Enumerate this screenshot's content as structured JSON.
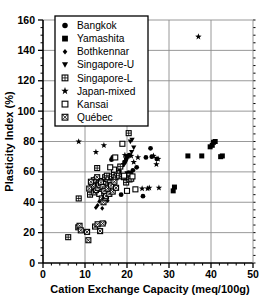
{
  "chart_data": {
    "type": "scatter",
    "title": "",
    "xlabel": "Cation Exchange Capacity (meq/100g)",
    "ylabel": "Plasticity Index (%)",
    "xlim": [
      0,
      50
    ],
    "ylim": [
      0,
      160
    ],
    "xticks": [
      0,
      10,
      20,
      30,
      40,
      50
    ],
    "yticks": [
      0,
      20,
      40,
      60,
      80,
      100,
      120,
      140,
      160
    ],
    "xtick_labels": [
      "0",
      "10",
      "20",
      "30",
      "40",
      "50"
    ],
    "ytick_labels": [
      "0",
      "20",
      "40",
      "60",
      "80",
      "100",
      "120",
      "140",
      "160"
    ],
    "x_minor_step": 2,
    "y_minor_step": 5,
    "grid": "major-both",
    "legend_position": "upper-left-inside",
    "series": [
      {
        "name": "Bangkok",
        "marker": "filled-circle",
        "points": [
          [
            14.6,
            26.5
          ],
          [
            15.2,
            49.5
          ],
          [
            15.8,
            50.0
          ],
          [
            16.6,
            69.5
          ],
          [
            16.3,
            68.0
          ],
          [
            18.2,
            60.5
          ],
          [
            18.6,
            45.0
          ],
          [
            19.0,
            64.5
          ],
          [
            19.4,
            66.5
          ],
          [
            19.8,
            68.5
          ],
          [
            20.1,
            70.0
          ],
          [
            20.5,
            71.0
          ],
          [
            20.4,
            59.5
          ],
          [
            20.9,
            59.0
          ],
          [
            21.4,
            61.0
          ],
          [
            22.3,
            63.0
          ],
          [
            23.8,
            44.0
          ],
          [
            24.5,
            69.5
          ],
          [
            25.6,
            75.5
          ],
          [
            25.9,
            70.0
          ],
          [
            27.1,
            68.5
          ]
        ]
      },
      {
        "name": "Yamashita",
        "marker": "filled-square",
        "points": [
          [
            31.0,
            47.5
          ],
          [
            31.3,
            50.0
          ],
          [
            34.5,
            70.5
          ],
          [
            37.8,
            70.5
          ],
          [
            39.8,
            76.5
          ],
          [
            40.3,
            77.5
          ],
          [
            40.6,
            79.5
          ],
          [
            41.0,
            80.0
          ],
          [
            42.3,
            70.0
          ],
          [
            42.7,
            70.5
          ]
        ]
      },
      {
        "name": "Bothkennar",
        "marker": "small-diamond",
        "points": [
          [
            12.6,
            36.5
          ],
          [
            13.0,
            38.0
          ],
          [
            13.4,
            40.5
          ],
          [
            13.8,
            42.0
          ],
          [
            14.1,
            36.0
          ],
          [
            14.4,
            39.5
          ],
          [
            14.8,
            44.5
          ],
          [
            15.1,
            46.5
          ],
          [
            15.4,
            41.0
          ],
          [
            15.8,
            48.0
          ],
          [
            16.1,
            52.0
          ],
          [
            16.4,
            54.0
          ],
          [
            16.8,
            50.5
          ],
          [
            17.1,
            56.0
          ]
        ]
      },
      {
        "name": "Singapore-U",
        "marker": "down-triangle",
        "points": [
          [
            20.8,
            80.0
          ],
          [
            21.2,
            81.0
          ],
          [
            21.6,
            76.0
          ],
          [
            21.1,
            73.0
          ],
          [
            19.6,
            66.0
          ],
          [
            20.0,
            59.0
          ],
          [
            20.3,
            57.0
          ]
        ]
      },
      {
        "name": "Singapore-L",
        "marker": "crossed-square",
        "points": [
          [
            6.0,
            17.0
          ],
          [
            8.5,
            42.5
          ],
          [
            11.2,
            45.0
          ],
          [
            11.6,
            50.0
          ],
          [
            12.0,
            52.0
          ],
          [
            12.3,
            53.5
          ],
          [
            12.7,
            55.0
          ],
          [
            13.1,
            52.5
          ],
          [
            13.5,
            50.0
          ],
          [
            12.9,
            62.5
          ],
          [
            14.0,
            54.0
          ],
          [
            14.4,
            52.0
          ],
          [
            14.8,
            56.5
          ],
          [
            15.2,
            57.5
          ],
          [
            15.6,
            55.0
          ],
          [
            16.0,
            53.0
          ],
          [
            16.4,
            57.0
          ],
          [
            16.9,
            58.0
          ],
          [
            17.3,
            56.5
          ],
          [
            17.7,
            59.0
          ],
          [
            18.1,
            57.5
          ],
          [
            18.4,
            63.5
          ],
          [
            18.9,
            57.0
          ],
          [
            19.3,
            56.5
          ],
          [
            19.8,
            53.0
          ],
          [
            20.2,
            57.5
          ],
          [
            20.6,
            55.0
          ],
          [
            21.0,
            55.5
          ],
          [
            20.4,
            85.5
          ]
        ]
      },
      {
        "name": "Japan-mixed",
        "marker": "star",
        "points": [
          [
            8.5,
            80.0
          ],
          [
            12.6,
            73.0
          ],
          [
            14.5,
            77.5
          ],
          [
            19.5,
            71.0
          ],
          [
            21.0,
            70.5
          ],
          [
            21.6,
            66.5
          ],
          [
            22.6,
            69.5
          ],
          [
            23.6,
            49.0
          ],
          [
            24.9,
            49.0
          ],
          [
            25.3,
            49.5
          ],
          [
            26.3,
            70.5
          ],
          [
            27.0,
            65.0
          ],
          [
            27.4,
            68.5
          ],
          [
            27.6,
            49.5
          ],
          [
            37.0,
            149.0
          ]
        ]
      },
      {
        "name": "Kansai",
        "marker": "open-square",
        "points": [
          [
            18.9,
            78.5
          ],
          [
            17.2,
            69.5
          ],
          [
            16.9,
            61.5
          ],
          [
            16.0,
            63.0
          ],
          [
            19.3,
            57.5
          ],
          [
            21.3,
            57.0
          ],
          [
            22.0,
            48.5
          ],
          [
            13.4,
            45.5
          ],
          [
            20.0,
            47.5
          ]
        ]
      },
      {
        "name": "Québec",
        "marker": "boxed-x-square",
        "points": [
          [
            8.4,
            23.5
          ],
          [
            8.7,
            24.5
          ],
          [
            9.0,
            21.5
          ],
          [
            10.5,
            20.5
          ],
          [
            10.8,
            15.0
          ],
          [
            12.4,
            24.0
          ],
          [
            13.0,
            25.5
          ],
          [
            13.6,
            21.0
          ],
          [
            14.2,
            26.0
          ],
          [
            14.0,
            42.5
          ],
          [
            14.4,
            40.0
          ],
          [
            14.8,
            43.0
          ],
          [
            15.2,
            46.0
          ],
          [
            12.2,
            46.5
          ],
          [
            12.6,
            48.0
          ],
          [
            13.0,
            49.5
          ],
          [
            13.4,
            51.5
          ],
          [
            11.8,
            51.0
          ],
          [
            12.1,
            54.5
          ],
          [
            13.8,
            53.0
          ],
          [
            14.2,
            50.0
          ],
          [
            14.6,
            47.5
          ],
          [
            15.0,
            44.0
          ],
          [
            15.4,
            49.0
          ],
          [
            15.8,
            45.5
          ],
          [
            16.2,
            51.0
          ],
          [
            16.6,
            47.0
          ],
          [
            17.0,
            53.5
          ],
          [
            17.4,
            49.5
          ],
          [
            11.4,
            53.5
          ],
          [
            12.9,
            56.5
          ],
          [
            11.0,
            49.0
          ]
        ]
      }
    ]
  },
  "legend": {
    "entries": [
      {
        "label": "Bangkok",
        "marker": "filled-circle"
      },
      {
        "label": "Yamashita",
        "marker": "filled-square"
      },
      {
        "label": "Bothkennar",
        "marker": "small-diamond"
      },
      {
        "label": "Singapore-U",
        "marker": "down-triangle"
      },
      {
        "label": "Singapore-L",
        "marker": "crossed-square"
      },
      {
        "label": "Japan-mixed",
        "marker": "star"
      },
      {
        "label": "Kansai",
        "marker": "open-square"
      },
      {
        "label": "Québec",
        "marker": "boxed-x-square"
      }
    ]
  },
  "colors": {
    "foreground": "#000000",
    "background": "#ffffff",
    "grid": "#8d8d8d"
  }
}
